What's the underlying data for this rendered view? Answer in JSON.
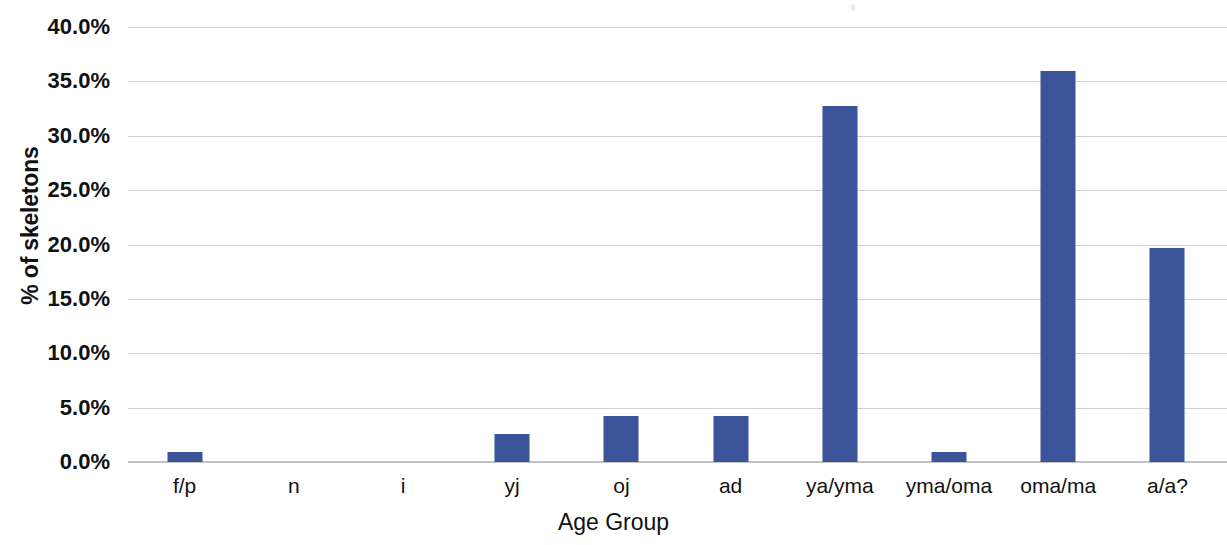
{
  "chart_data": {
    "type": "bar",
    "title": "",
    "xlabel": "Age Group",
    "ylabel": "% of skeletons",
    "categories": [
      "f/p",
      "n",
      "i",
      "yj",
      "oj",
      "ad",
      "ya/yma",
      "yma/oma",
      "oma/ma",
      "a/a?"
    ],
    "values": [
      0.9,
      0.0,
      0.0,
      2.6,
      4.2,
      4.2,
      32.7,
      0.9,
      36.0,
      19.7
    ],
    "value_unit": "%",
    "ylim": [
      0,
      40
    ],
    "ytick_values": [
      0,
      5,
      10,
      15,
      20,
      25,
      30,
      35,
      40
    ],
    "ytick_labels": [
      "0.0%",
      "5.0%",
      "10.0%",
      "15.0%",
      "20.0%",
      "25.0%",
      "30.0%",
      "35.0%",
      "40.0%"
    ],
    "grid": true,
    "grid_axis": "y",
    "legend": false,
    "legend_position": "none",
    "series": [
      {
        "name": "% of skeletons",
        "color": "#3b5398",
        "values": [
          0.9,
          0.0,
          0.0,
          2.6,
          4.2,
          4.2,
          32.7,
          0.9,
          36.0,
          19.7
        ]
      }
    ]
  },
  "colors": {
    "bar": "#3b5398",
    "gridline": "#d2d2d2",
    "axis_line": "#c2c2c2",
    "text": "#111111",
    "background": "#ffffff"
  },
  "axes": {
    "y_title": "% of skeletons",
    "x_title": "Age Group"
  }
}
